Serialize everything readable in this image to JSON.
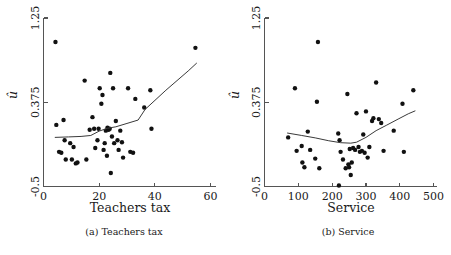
{
  "figure": {
    "panels": [
      {
        "key": "teachers_tax",
        "subcaption": "(a)  Teachers tax"
      },
      {
        "key": "service",
        "subcaption": "(b)  Service"
      }
    ]
  },
  "chart_data": [
    {
      "type": "scatter",
      "title": "",
      "xlabel": "Teachers tax",
      "ylabel": "û",
      "xlim": [
        0,
        62
      ],
      "ylim": [
        -0.5,
        1.25
      ],
      "xticks": [
        0,
        20,
        40,
        60
      ],
      "xticklabels": [
        "0",
        "20",
        "40",
        "60"
      ],
      "yticks": [
        -0.5,
        0.375,
        1.25
      ],
      "yticklabels": [
        "-0.5",
        "0.375",
        "1.25"
      ],
      "grid": false,
      "legend": null,
      "marker": "filled-circle",
      "marker_color": "#111111",
      "line_color": "#3a3a3a",
      "points": [
        {
          "x": 4.3,
          "y": 1.0
        },
        {
          "x": 4.6,
          "y": 0.14
        },
        {
          "x": 5.6,
          "y": -0.14
        },
        {
          "x": 6.4,
          "y": -0.15
        },
        {
          "x": 7.2,
          "y": 0.19
        },
        {
          "x": 7.6,
          "y": -0.02
        },
        {
          "x": 8.0,
          "y": -0.22
        },
        {
          "x": 9.6,
          "y": -0.05
        },
        {
          "x": 10.2,
          "y": -0.22
        },
        {
          "x": 10.8,
          "y": -0.09
        },
        {
          "x": 11.6,
          "y": -0.26
        },
        {
          "x": 12.2,
          "y": -0.25
        },
        {
          "x": 14.8,
          "y": 0.6
        },
        {
          "x": 15.4,
          "y": -0.22
        },
        {
          "x": 16.6,
          "y": 0.09
        },
        {
          "x": 17.6,
          "y": 0.22
        },
        {
          "x": 18.2,
          "y": 0.1
        },
        {
          "x": 18.6,
          "y": -0.1
        },
        {
          "x": 19.4,
          "y": -0.02
        },
        {
          "x": 19.8,
          "y": 0.1
        },
        {
          "x": 20.2,
          "y": 0.52
        },
        {
          "x": 20.8,
          "y": 0.36
        },
        {
          "x": 21.2,
          "y": 0.45
        },
        {
          "x": 21.6,
          "y": -0.12
        },
        {
          "x": 22.0,
          "y": -0.05
        },
        {
          "x": 22.4,
          "y": 0.08
        },
        {
          "x": 22.8,
          "y": -0.18
        },
        {
          "x": 23.0,
          "y": 0.11
        },
        {
          "x": 23.4,
          "y": 0.09
        },
        {
          "x": 23.8,
          "y": 0.1
        },
        {
          "x": 24.0,
          "y": 0.68
        },
        {
          "x": 24.2,
          "y": -0.36
        },
        {
          "x": 24.6,
          "y": 0.02
        },
        {
          "x": 25.0,
          "y": 0.52
        },
        {
          "x": 25.4,
          "y": -0.05
        },
        {
          "x": 26.0,
          "y": 0.18
        },
        {
          "x": 26.6,
          "y": -0.02
        },
        {
          "x": 27.0,
          "y": -0.12
        },
        {
          "x": 27.6,
          "y": 0.08
        },
        {
          "x": 28.2,
          "y": -0.04
        },
        {
          "x": 28.6,
          "y": -0.2
        },
        {
          "x": 30.4,
          "y": 0.52
        },
        {
          "x": 31.2,
          "y": -0.14
        },
        {
          "x": 32.2,
          "y": -0.15
        },
        {
          "x": 33.0,
          "y": 0.41
        },
        {
          "x": 36.2,
          "y": 0.32
        },
        {
          "x": 38.4,
          "y": 0.5
        },
        {
          "x": 38.8,
          "y": 0.1
        },
        {
          "x": 54.6,
          "y": 0.94
        }
      ],
      "fit_line": [
        {
          "x": 4.2,
          "y": 0.01
        },
        {
          "x": 9.0,
          "y": 0.015
        },
        {
          "x": 13.5,
          "y": 0.02
        },
        {
          "x": 17.0,
          "y": 0.03
        },
        {
          "x": 20.0,
          "y": 0.075
        },
        {
          "x": 23.0,
          "y": 0.105
        },
        {
          "x": 26.0,
          "y": 0.12
        },
        {
          "x": 30.0,
          "y": 0.155
        },
        {
          "x": 34.0,
          "y": 0.19
        },
        {
          "x": 36.5,
          "y": 0.3
        },
        {
          "x": 44.0,
          "y": 0.5
        },
        {
          "x": 52.0,
          "y": 0.7
        },
        {
          "x": 55.0,
          "y": 0.78
        }
      ]
    },
    {
      "type": "scatter",
      "title": "",
      "xlabel": "Service",
      "ylabel": "û",
      "xlim": [
        0,
        510
      ],
      "ylim": [
        -0.5,
        1.25
      ],
      "xticks": [
        0,
        100,
        200,
        300,
        400,
        500
      ],
      "xticklabels": [
        "0",
        "100",
        "200",
        "300",
        "400",
        "500"
      ],
      "yticks": [
        -0.5,
        0.375,
        1.25
      ],
      "yticklabels": [
        "-0.5",
        "0.375",
        "1.25"
      ],
      "grid": false,
      "legend": null,
      "marker": "filled-circle",
      "marker_color": "#111111",
      "line_color": "#3a3a3a",
      "points": [
        {
          "x": 70,
          "y": 0.01
        },
        {
          "x": 90,
          "y": 0.52
        },
        {
          "x": 95,
          "y": -0.13
        },
        {
          "x": 110,
          "y": -0.08
        },
        {
          "x": 112,
          "y": -0.25
        },
        {
          "x": 118,
          "y": -0.3
        },
        {
          "x": 128,
          "y": 0.07
        },
        {
          "x": 135,
          "y": -0.12
        },
        {
          "x": 150,
          "y": -0.21
        },
        {
          "x": 155,
          "y": 0.38
        },
        {
          "x": 158,
          "y": 1.0
        },
        {
          "x": 162,
          "y": -0.31
        },
        {
          "x": 218,
          "y": 0.05
        },
        {
          "x": 220,
          "y": -0.49
        },
        {
          "x": 222,
          "y": -0.02
        },
        {
          "x": 225,
          "y": -0.14
        },
        {
          "x": 232,
          "y": -0.22
        },
        {
          "x": 240,
          "y": -0.31
        },
        {
          "x": 245,
          "y": 0.46
        },
        {
          "x": 248,
          "y": -0.27
        },
        {
          "x": 250,
          "y": -0.3
        },
        {
          "x": 252,
          "y": -0.11
        },
        {
          "x": 255,
          "y": -0.38
        },
        {
          "x": 258,
          "y": -0.25
        },
        {
          "x": 262,
          "y": -0.1
        },
        {
          "x": 268,
          "y": -0.12
        },
        {
          "x": 272,
          "y": 0.26
        },
        {
          "x": 278,
          "y": -0.09
        },
        {
          "x": 282,
          "y": -0.14
        },
        {
          "x": 288,
          "y": -0.13
        },
        {
          "x": 292,
          "y": 0.04
        },
        {
          "x": 296,
          "y": -0.15
        },
        {
          "x": 300,
          "y": 0.28
        },
        {
          "x": 305,
          "y": -0.2
        },
        {
          "x": 310,
          "y": -0.09
        },
        {
          "x": 318,
          "y": 0.18
        },
        {
          "x": 322,
          "y": 0.21
        },
        {
          "x": 330,
          "y": 0.58
        },
        {
          "x": 338,
          "y": 0.2
        },
        {
          "x": 345,
          "y": 0.16
        },
        {
          "x": 352,
          "y": -0.13
        },
        {
          "x": 382,
          "y": 0.08
        },
        {
          "x": 408,
          "y": 0.36
        },
        {
          "x": 412,
          "y": -0.14
        },
        {
          "x": 440,
          "y": 0.5
        }
      ],
      "fit_line": [
        {
          "x": 68,
          "y": 0.055
        },
        {
          "x": 110,
          "y": 0.03
        },
        {
          "x": 150,
          "y": 0.005
        },
        {
          "x": 190,
          "y": -0.025
        },
        {
          "x": 225,
          "y": -0.045
        },
        {
          "x": 255,
          "y": -0.05
        },
        {
          "x": 272,
          "y": -0.04
        },
        {
          "x": 300,
          "y": 0.01
        },
        {
          "x": 330,
          "y": 0.08
        },
        {
          "x": 360,
          "y": 0.135
        },
        {
          "x": 395,
          "y": 0.2
        },
        {
          "x": 425,
          "y": 0.255
        },
        {
          "x": 445,
          "y": 0.285
        }
      ]
    }
  ]
}
